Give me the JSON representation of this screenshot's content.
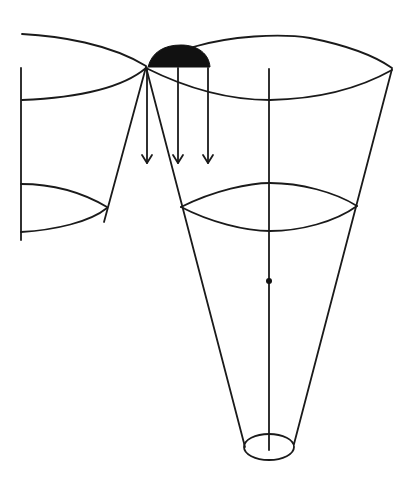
{
  "diagram": {
    "colors": {
      "stroke": "#1a1a1a",
      "fill_cap": "#111111",
      "background": "#ffffff"
    },
    "elements": [
      {
        "id": "left-cone",
        "type": "partial cone outline"
      },
      {
        "id": "right-cone",
        "type": "inverted cone with three elliptical cross-sections"
      },
      {
        "id": "cap",
        "type": "filled semicircle"
      },
      {
        "id": "arrows",
        "type": "three downward arrows",
        "count": 3
      },
      {
        "id": "axis",
        "type": "vertical axis line"
      },
      {
        "id": "axis-dot",
        "type": "point marker"
      }
    ]
  }
}
